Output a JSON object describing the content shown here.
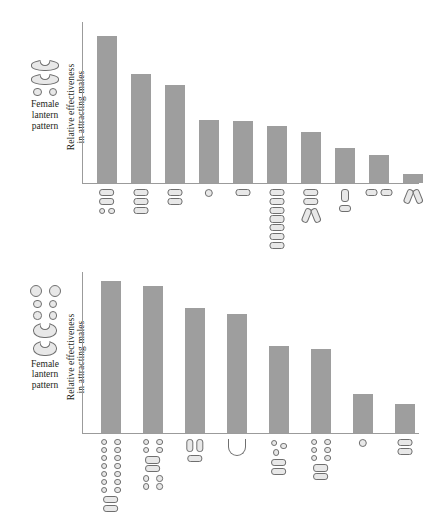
{
  "figure": {
    "panels": [
      {
        "id": "top",
        "legend_caption_line1": "Female",
        "legend_caption_line2": "lantern",
        "legend_caption_line3": "pattern",
        "ytitle_line1": "Relative effectiveness",
        "ytitle_line2": "in attracting males"
      },
      {
        "id": "bottom",
        "legend_caption_line1": "Female",
        "legend_caption_line2": "lantern",
        "legend_caption_line3": "pattern",
        "ytitle_line1": "Relative effectiveness",
        "ytitle_line2": "in attracting males"
      }
    ]
  },
  "chart_data": [
    {
      "type": "bar",
      "title": "Relative effectiveness in attracting males (species A lantern patterns)",
      "xlabel": "Female lantern pattern",
      "ylabel": "Relative effectiveness in attracting males",
      "grid": false,
      "legend": "none",
      "ylim": [
        0,
        100
      ],
      "axis_tick_labels": [],
      "categories": [
        "two-ovals-over-two-small-circles",
        "three-stacked-ovals",
        "two-stacked-ovals",
        "single-small-circle",
        "single-oval",
        "seven-stacked-ovals",
        "two-ovals-over-v-slashes",
        "vertical-oval-over-horizontal-oval",
        "two-side-by-side-ovals",
        "v-slashes-only"
      ],
      "values": [
        100,
        74,
        67,
        43,
        42,
        39,
        35,
        24,
        19,
        6
      ]
    },
    {
      "type": "bar",
      "title": "Relative effectiveness in attracting males (species B lantern patterns)",
      "xlabel": "Female lantern pattern",
      "ylabel": "Relative effectiveness in attracting males",
      "grid": false,
      "legend": "none",
      "ylim": [
        0,
        100
      ],
      "axis_tick_labels": [],
      "categories": [
        "two-columns-of-seven-circles-over-two-ovals",
        "circles-ovals-circles-stack",
        "two-vertical-ovals-over-one-oval",
        "u-bend",
        "scattered-circles-over-two-ovals",
        "two-columns-of-circles-over-two-ovals",
        "single-circle",
        "two-stacked-ovals"
      ],
      "values": [
        100,
        97,
        82,
        78,
        57,
        55,
        26,
        19
      ]
    }
  ]
}
